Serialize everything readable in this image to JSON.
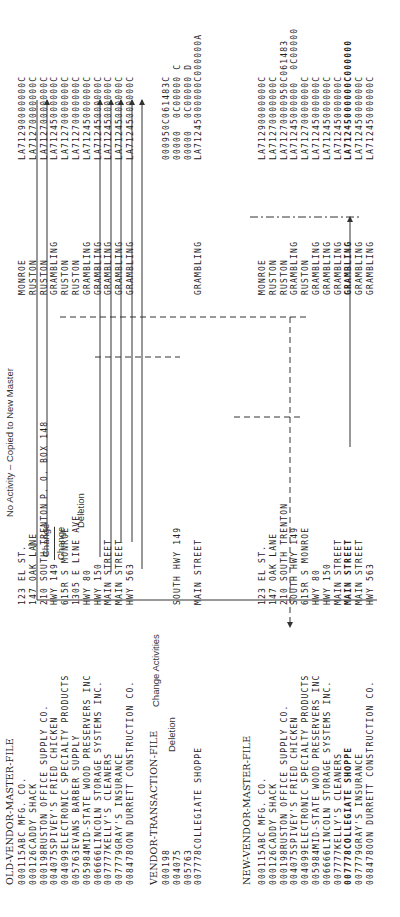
{
  "old_master": {
    "title": "OLD-VENDOR-MASTER-FILE",
    "rows": [
      {
        "id": "000115",
        "name": "ABC MFG. CO.",
        "address": "123 EL ST.",
        "city": "MONROE",
        "code": "LA71290000000C"
      },
      {
        "id": "000126",
        "name": "CADDY SHACK",
        "address": "147 OAK LANE",
        "city": "RUSTON",
        "code": "LA71270000000C"
      },
      {
        "id": "000198",
        "name": "RUSTON OFFICE SUPPLY CO.",
        "address": "210 SOUTH TRENTON",
        "city": "RUSTON",
        "code": "LA71270000000C"
      },
      {
        "id": "004075",
        "name": "SPIVEY'S FRIED CHICKEN",
        "address": "HWY 149",
        "city": "GRAMBLING",
        "code": "LA71245000000C"
      },
      {
        "id": "004099",
        "name": "ELECTRONIC SPECIALTY PRODUCTS",
        "address": "615R S MONROE",
        "city": "RUSTON",
        "code": "LA71270000000C"
      },
      {
        "id": "005763",
        "name": "EVANS BARBER SUPPLY",
        "address": "1305 E LINE AVE.",
        "city": "RUSTON",
        "code": "LA71270000000C"
      },
      {
        "id": "005984",
        "name": "MID-STATE WOOD PRESERVERS INC",
        "address": "HWY 80",
        "city": "GRAMBLING",
        "code": "LA71245000000C"
      },
      {
        "id": "006666",
        "name": "LINCOLN STORAGE SYSTEMS INC.",
        "address": "HWY 150",
        "city": "GRAMBLING",
        "code": "LA71245000000C"
      },
      {
        "id": "007777",
        "name": "KELLY'S CLEANERS",
        "address": "MAIN STREET",
        "city": "GRAMBLING",
        "code": "LA71245000000C"
      },
      {
        "id": "007779",
        "name": "GRAY'S INSURANCE",
        "address": "MAIN STREET",
        "city": "GRAMBLING",
        "code": "LA71245000000C"
      },
      {
        "id": "008478",
        "name": "OON DURRETT CONSTRUCTION CO.",
        "address": "HWY 563",
        "city": "GRAMBLING",
        "code": "LA71245000000C"
      }
    ]
  },
  "transaction": {
    "title": "VENDOR-TRANSACTION-FILE",
    "rows": [
      {
        "id": "000198",
        "name": "",
        "address": "",
        "city": "",
        "code": "000950C061483C"
      },
      {
        "id": "004075",
        "name": "",
        "address": "SOUTH HWY 149",
        "city": "",
        "code": "00000  0C00000 C"
      },
      {
        "id": "005763",
        "name": "",
        "address": "",
        "city": "",
        "code": "00000  0C00000 D"
      },
      {
        "id": "007778",
        "name": "COLLEGIATE SHOPPE",
        "address": "MAIN STREET",
        "city": "GRAMBLING",
        "code": "LA71245000000C000000A"
      }
    ]
  },
  "new_master": {
    "title": "NEW-VENDOR-MASTER-FILE",
    "rows": [
      {
        "id": "000115",
        "name": "ABC MFG. CO.",
        "address": "123 EL ST.",
        "city": "MONROE",
        "code": "LA71290000000C",
        "bold": false
      },
      {
        "id": "000126",
        "name": "CADDY SHACK",
        "address": "147 OAK LANE",
        "city": "RUSTON",
        "code": "LA71270000000C",
        "bold": false
      },
      {
        "id": "000198",
        "name": "RUSTON OFFICE SUPPLY CO.",
        "address": "210 SOUTH TRENTON",
        "city": "RUSTON",
        "code": "LA71270000950C061483",
        "bold": false
      },
      {
        "id": "004075",
        "name": "SPIVEY'S FRIED CHICKEN",
        "address": "SOUTH HWY 149",
        "city": "GRAMBLING",
        "code": "LA71245000000  0C00000",
        "bold": false
      },
      {
        "id": "004099",
        "name": "ELECTRONIC SPECIALTY PRODUCTS",
        "address": "615R S MONROE",
        "city": "RUSTON",
        "code": "LA71270000000C",
        "bold": false
      },
      {
        "id": "005984",
        "name": "MID-STATE WOOD PRESERVERS INC",
        "address": "HWY 80",
        "city": "GRAMBLING",
        "code": "LA71245000000C",
        "bold": false
      },
      {
        "id": "006666",
        "name": "LINCOLN STORAGE SYSTEMS INC.",
        "address": "HWY 150",
        "city": "GRAMBLING",
        "code": "LA71245000000C",
        "bold": false
      },
      {
        "id": "007777",
        "name": "KELLY'S CLEANERS",
        "address": "MAIN STREET",
        "city": "GRAMBLING",
        "code": "LA71245000000C",
        "bold": false
      },
      {
        "id": "007778",
        "name": "COLLEGIATE SHOPPE",
        "address": "MAIN STREET",
        "city": "GRAMBLING",
        "code": "LA71245000000C000000",
        "bold": true
      },
      {
        "id": "007779",
        "name": "GRAY'S INSURANCE",
        "address": "MAIN STREET",
        "city": "GRAMBLING",
        "code": "LA71245000000C",
        "bold": false
      },
      {
        "id": "008478",
        "name": "OON DURRETT CONSTRUCTION CO.",
        "address": "HWY 563",
        "city": "GRAMBLING",
        "code": "LA71245000000C",
        "bold": false
      }
    ]
  },
  "annotations": {
    "no_activity": "No Activity – Copied to New Master",
    "change_1": "Change",
    "change_2": "Change",
    "change_po": "P. O. BOX 148",
    "deletion_old": "Deletion",
    "deletion_trans": "Deletion",
    "change_activities": "Change Activities"
  }
}
